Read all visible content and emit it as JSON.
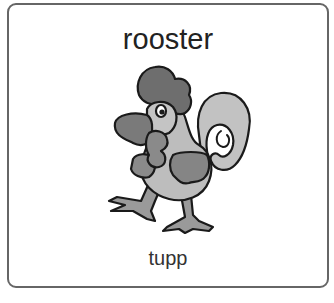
{
  "card": {
    "title": "rooster",
    "caption": "tupp",
    "image": {
      "subject": "rooster-illustration",
      "colors": {
        "outline": "#1a1a1a",
        "body": "#bdbdbd",
        "comb": "#6e6e6e",
        "beak": "#7a7a7a",
        "wing": "#858585",
        "legs": "#9a9a9a"
      }
    },
    "border_color": "#666666"
  }
}
